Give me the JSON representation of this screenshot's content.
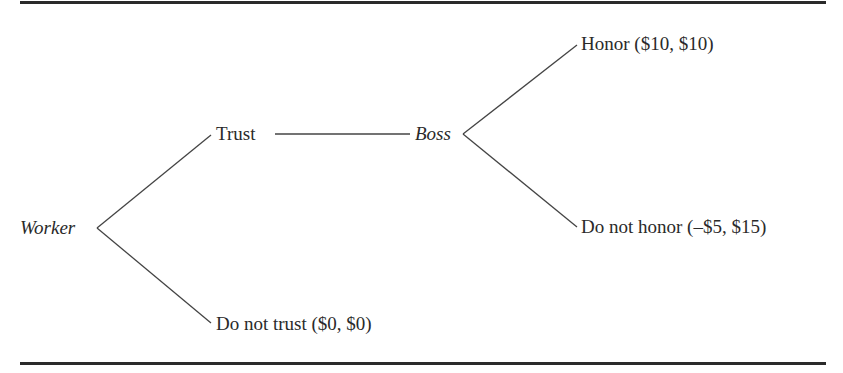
{
  "diagram": {
    "type": "game-tree",
    "nodes": {
      "worker": {
        "label": "Worker",
        "player": true
      },
      "boss": {
        "label": "Boss",
        "player": true
      }
    },
    "branches": {
      "trust": {
        "label": "Trust"
      },
      "do_not_trust": {
        "label": "Do not trust ($0, $0)",
        "action": "Do not trust",
        "payoff": "($0, $0)"
      },
      "honor": {
        "label": "Honor ($10, $10)",
        "action": "Honor",
        "payoff": "($10, $10)"
      },
      "do_not_honor": {
        "label": "Do not honor (–$5, $15)",
        "action": "Do not honor",
        "payoff": "(–$5, $15)"
      }
    },
    "colors": {
      "ink": "#2a2a2a",
      "background": "#ffffff"
    }
  }
}
